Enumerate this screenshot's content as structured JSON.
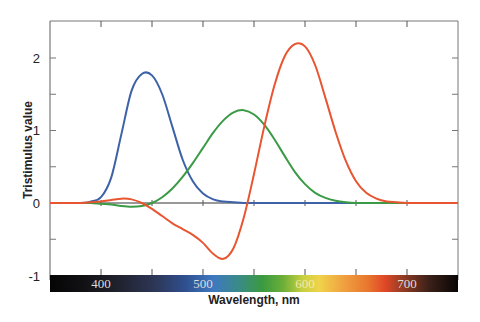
{
  "chart_data": {
    "type": "line",
    "title": "",
    "xlabel": "Wavelength, nm",
    "ylabel": "Tristimulus value",
    "xlim": [
      350,
      750
    ],
    "ylim": [
      -1,
      2.5
    ],
    "x_ticks": [
      400,
      500,
      600,
      700
    ],
    "x_minor_ticks": [
      450,
      550,
      650
    ],
    "y_ticks": [
      -1,
      0,
      1,
      2
    ],
    "y_minor_ticks": [
      -0.5,
      0.5,
      1.5
    ],
    "grid": false,
    "legend": null,
    "colorbar": "visible spectrum strip along x-axis (black-violet-blue-green-yellow-orange-red-black)",
    "x": [
      380,
      390,
      400,
      410,
      420,
      430,
      440,
      450,
      460,
      470,
      480,
      490,
      500,
      510,
      520,
      530,
      540,
      550,
      560,
      570,
      580,
      590,
      600,
      610,
      620,
      630,
      640,
      650,
      660,
      670,
      680,
      690,
      700,
      720,
      750
    ],
    "series": [
      {
        "name": "b (blue)",
        "color": "#3d62a8",
        "values": [
          0.0,
          0.02,
          0.08,
          0.35,
          0.95,
          1.55,
          1.78,
          1.76,
          1.5,
          1.05,
          0.6,
          0.3,
          0.13,
          0.05,
          0.02,
          0.01,
          0.0,
          0.0,
          0.0,
          0.0,
          0.0,
          0.0,
          0.0,
          0.0,
          0.0,
          0.0,
          0.0,
          0.0,
          0.0,
          0.0,
          0.0,
          0.0,
          0.0,
          0.0,
          0.0
        ]
      },
      {
        "name": "g (green)",
        "color": "#3a9a45",
        "values": [
          0.0,
          0.0,
          -0.01,
          -0.02,
          -0.04,
          -0.05,
          -0.04,
          0.0,
          0.08,
          0.2,
          0.36,
          0.55,
          0.76,
          0.97,
          1.14,
          1.25,
          1.28,
          1.22,
          1.08,
          0.88,
          0.65,
          0.43,
          0.26,
          0.14,
          0.07,
          0.03,
          0.01,
          0.0,
          0.0,
          0.0,
          0.0,
          0.0,
          0.0,
          0.0,
          0.0
        ]
      },
      {
        "name": "r (red)",
        "color": "#e85530",
        "values": [
          0.0,
          0.01,
          0.02,
          0.04,
          0.06,
          0.05,
          0.0,
          -0.08,
          -0.18,
          -0.28,
          -0.36,
          -0.44,
          -0.55,
          -0.7,
          -0.77,
          -0.62,
          -0.2,
          0.4,
          1.05,
          1.62,
          2.02,
          2.19,
          2.16,
          1.9,
          1.45,
          0.98,
          0.58,
          0.3,
          0.14,
          0.06,
          0.02,
          0.01,
          0.0,
          0.0,
          0.0
        ]
      }
    ]
  },
  "axes": {
    "y_tick_labels": [
      "2",
      "1",
      "0",
      "-1"
    ],
    "x_tick_labels": [
      "400",
      "500",
      "600",
      "700"
    ],
    "ylabel": "Tristimulus value",
    "xlabel": "Wavelength, nm"
  }
}
